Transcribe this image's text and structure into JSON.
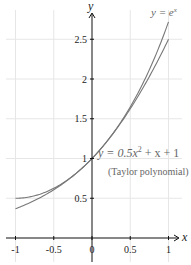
{
  "chart_data": {
    "type": "line",
    "title": "",
    "xlabel": "x",
    "ylabel": "y",
    "xlim": [
      -1.0,
      1.0
    ],
    "ylim": [
      0,
      2.75
    ],
    "grid": true,
    "x_ticks": [
      "-1",
      "-0.5",
      "0",
      "0.5",
      "1"
    ],
    "y_ticks": [
      "0.5",
      "1",
      "1.5",
      "2",
      "2.5"
    ],
    "series": [
      {
        "name": "y = e^x",
        "function": "exp(x)",
        "x": [
          -1,
          -0.75,
          -0.5,
          -0.25,
          0,
          0.25,
          0.5,
          0.75,
          1
        ],
        "values": [
          0.368,
          0.472,
          0.607,
          0.779,
          1.0,
          1.284,
          1.649,
          2.117,
          2.718
        ]
      },
      {
        "name": "y = 0.5x^2 + x + 1 (Taylor polynomial)",
        "function": "0.5*x^2 + x + 1",
        "x": [
          -1,
          -0.75,
          -0.5,
          -0.25,
          0,
          0.25,
          0.5,
          0.75,
          1
        ],
        "values": [
          0.5,
          0.531,
          0.625,
          0.781,
          1.0,
          1.281,
          1.625,
          2.031,
          2.5
        ]
      }
    ],
    "annotations": [
      {
        "text": "y = e^x",
        "position": "top-right"
      },
      {
        "text": "y = 0.5x^2 + x + 1",
        "position": "right, near y=1"
      },
      {
        "text": "(Taylor polynomial)",
        "position": "right, below formula"
      }
    ]
  },
  "labels": {
    "x_axis": "x",
    "y_axis": "y",
    "exp_eq_lhs": "y = e",
    "exp_eq_sup": "x",
    "taylor_eq_a": "y = 0.5x",
    "taylor_eq_sup": "2",
    "taylor_eq_b": " + x + 1",
    "taylor_caption": "(Taylor polynomial)"
  },
  "colors": {
    "curve": "#777777",
    "axis": "#111111",
    "grid": "#e6e6e6",
    "label": "#666666"
  }
}
